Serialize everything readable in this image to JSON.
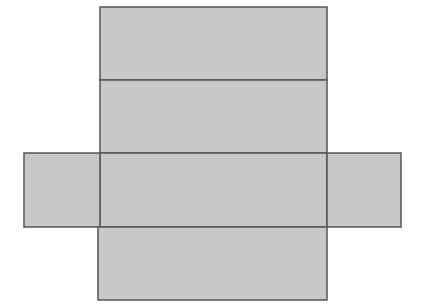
{
  "diagram": {
    "type": "net-of-rectangular-prism",
    "fill": "#c8c8c8",
    "stroke": "#555555",
    "faces": [
      {
        "name": "top-face",
        "x": 100,
        "y": 7,
        "w": 227,
        "h": 73
      },
      {
        "name": "back-face",
        "x": 100,
        "y": 80,
        "w": 227,
        "h": 73
      },
      {
        "name": "center-face",
        "x": 100,
        "y": 153,
        "w": 227,
        "h": 74
      },
      {
        "name": "left-flap",
        "x": 24,
        "y": 153,
        "w": 76,
        "h": 74
      },
      {
        "name": "right-flap",
        "x": 327,
        "y": 153,
        "w": 74,
        "h": 74
      },
      {
        "name": "bottom-face",
        "x": 98,
        "y": 227,
        "w": 229,
        "h": 73
      }
    ]
  }
}
